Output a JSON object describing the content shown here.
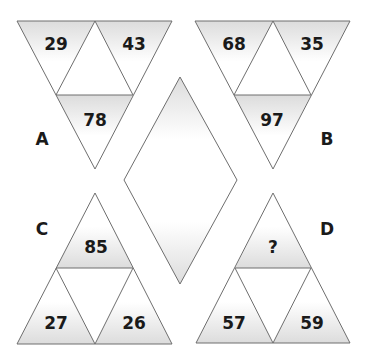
{
  "puzzle": {
    "description": "Number triangle puzzle: find the missing value in triangle D",
    "colors": {
      "line": "#6e6e6e",
      "shade": "#e4e4e4",
      "text": "#1a1a1a",
      "background": "#ffffff"
    },
    "triangles": {
      "A": {
        "label": "A",
        "orientation": "down",
        "left": "29",
        "right": "43",
        "bottom": "78"
      },
      "B": {
        "label": "B",
        "orientation": "down",
        "left": "68",
        "right": "35",
        "bottom": "97"
      },
      "C": {
        "label": "C",
        "orientation": "up",
        "top": "85",
        "left": "27",
        "right": "26"
      },
      "D": {
        "label": "D",
        "orientation": "up",
        "top": "?",
        "left": "57",
        "right": "59"
      }
    },
    "center_shape": "diamond"
  }
}
